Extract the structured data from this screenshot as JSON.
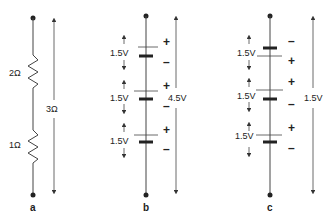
{
  "diagrams": {
    "a": {
      "caption": "a",
      "resistors": [
        {
          "label": "2Ω"
        },
        {
          "label": "1Ω"
        }
      ],
      "total": "3Ω"
    },
    "b": {
      "caption": "b",
      "cells": [
        {
          "voltage": "1.5V",
          "top_sign": "+",
          "bottom_sign": "–"
        },
        {
          "voltage": "1.5V",
          "top_sign": "+",
          "bottom_sign": "–"
        },
        {
          "voltage": "1.5V",
          "top_sign": "+",
          "bottom_sign": "–"
        }
      ],
      "total": "4.5V"
    },
    "c": {
      "caption": "c",
      "cells": [
        {
          "voltage": "1.5V",
          "top_sign": "–",
          "bottom_sign": "+"
        },
        {
          "voltage": "1.5V",
          "top_sign": "+",
          "bottom_sign": "–"
        },
        {
          "voltage": "1.5V",
          "top_sign": "+",
          "bottom_sign": "–"
        }
      ],
      "total": "1.5V"
    }
  }
}
